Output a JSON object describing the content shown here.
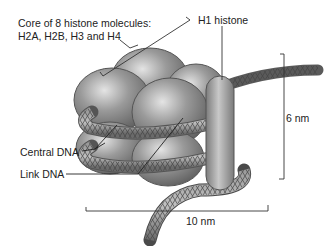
{
  "diagram": {
    "labels": {
      "core_line1": "Core of 8 histone molecules:",
      "core_line2": "H2A, H2B, H3 and H4",
      "h1": "H1 histone",
      "central_dna": "Central DNA",
      "link_dna": "Link DNA",
      "height_dim": "6 nm",
      "width_dim": "10 nm"
    },
    "colors": {
      "histone": "#8a8a8a",
      "histone_highlight": "#d8d8d8",
      "dna": "#777777",
      "h1": "#9a9a9a",
      "line": "#333333"
    }
  }
}
